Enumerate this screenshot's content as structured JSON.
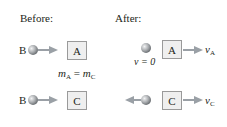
{
  "headers": {
    "before": "Before:",
    "after": "After:"
  },
  "before": {
    "row1": {
      "ball_label": "B",
      "block_label": "A"
    },
    "row2": {
      "ball_label": "B",
      "block_label": "C"
    }
  },
  "mass_relation": {
    "m1": "m",
    "m1_sub": "A",
    "equals": "=",
    "m2": "m",
    "m2_sub": "C"
  },
  "after": {
    "row1": {
      "ball_velocity": "v = 0",
      "block_label": "A",
      "velocity_symbol": "v",
      "velocity_sub": "A"
    },
    "row2": {
      "block_label": "C",
      "velocity_symbol": "v",
      "velocity_sub": "C"
    }
  },
  "colors": {
    "ball": "#a9acaf",
    "arrow": "#9aa0a6",
    "box_fill": "#efefef",
    "box_border": "#9a9a9a",
    "text": "#231f20"
  }
}
